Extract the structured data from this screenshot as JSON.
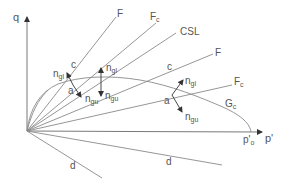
{
  "diagram": {
    "type": "q-p' stress space diagram (critical state soil mechanics)",
    "axes": {
      "y_label": "q",
      "x_label": "p'",
      "x_end_label": "p'o",
      "x_end_label_main": "p'",
      "x_end_label_sub": "o"
    },
    "lines": [
      {
        "id": "F_upper",
        "label": "F"
      },
      {
        "id": "Fc_upper",
        "label_main": "F",
        "label_sub": "c"
      },
      {
        "id": "CSL",
        "label": "CSL"
      },
      {
        "id": "F_lower",
        "label": "F"
      },
      {
        "id": "Fc_lower",
        "label_main": "F",
        "label_sub": "c"
      },
      {
        "id": "d_upper",
        "label": "d"
      },
      {
        "id": "d_lower",
        "label": "d"
      }
    ],
    "curves": [
      {
        "id": "Gc",
        "label_main": "G",
        "label_sub": "c"
      }
    ],
    "annotations": {
      "c_left": "c",
      "c_right": "c",
      "a_left": "a",
      "a_right": "a",
      "n_gl_main": "n",
      "n_gl_sub": "gl",
      "n_gu_main": "n",
      "n_gu_sub": "gu"
    },
    "colors": {
      "lines": "#8a8a8a",
      "axes": "#6a6a6a",
      "arrows": "#333333",
      "text": "#555555"
    }
  }
}
